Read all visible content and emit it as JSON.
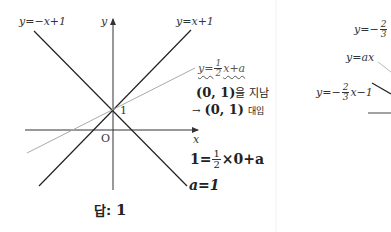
{
  "left_panel": {
    "labels": {
      "line_neg": "y=−x+1",
      "line_pos": "y=x+1",
      "y_axis": "y",
      "x_axis": "x",
      "origin": "O",
      "intercept": "1",
      "a_label": "a=1"
    },
    "annotation": {
      "eq_prefix": "y=",
      "eq_num": "1",
      "eq_den": "2",
      "eq_suffix": "x+a",
      "passes_point": "(0, 1)",
      "passes_text": "을 지남",
      "arrow": "→",
      "subst_point": "(0, 1)",
      "subst_text": "대입",
      "calc_prefix": "1=",
      "calc_num": "1",
      "calc_den": "2",
      "calc_suffix": "×0+a",
      "result": "a=1"
    },
    "answer": {
      "label": "답:",
      "value": "1"
    },
    "colors": {
      "line": "#222222",
      "gray_line": "#aaaaaa",
      "axis": "#333333"
    }
  },
  "right_panel": {
    "labels": {
      "top_eq_prefix": "y=−",
      "top_eq_num": "2",
      "top_eq_den": "3",
      "ax_eq": "y=ax",
      "bottom_eq_prefix": "y=−",
      "bottom_eq_num": "2",
      "bottom_eq_den": "3",
      "bottom_eq_suffix": "x−1"
    }
  }
}
